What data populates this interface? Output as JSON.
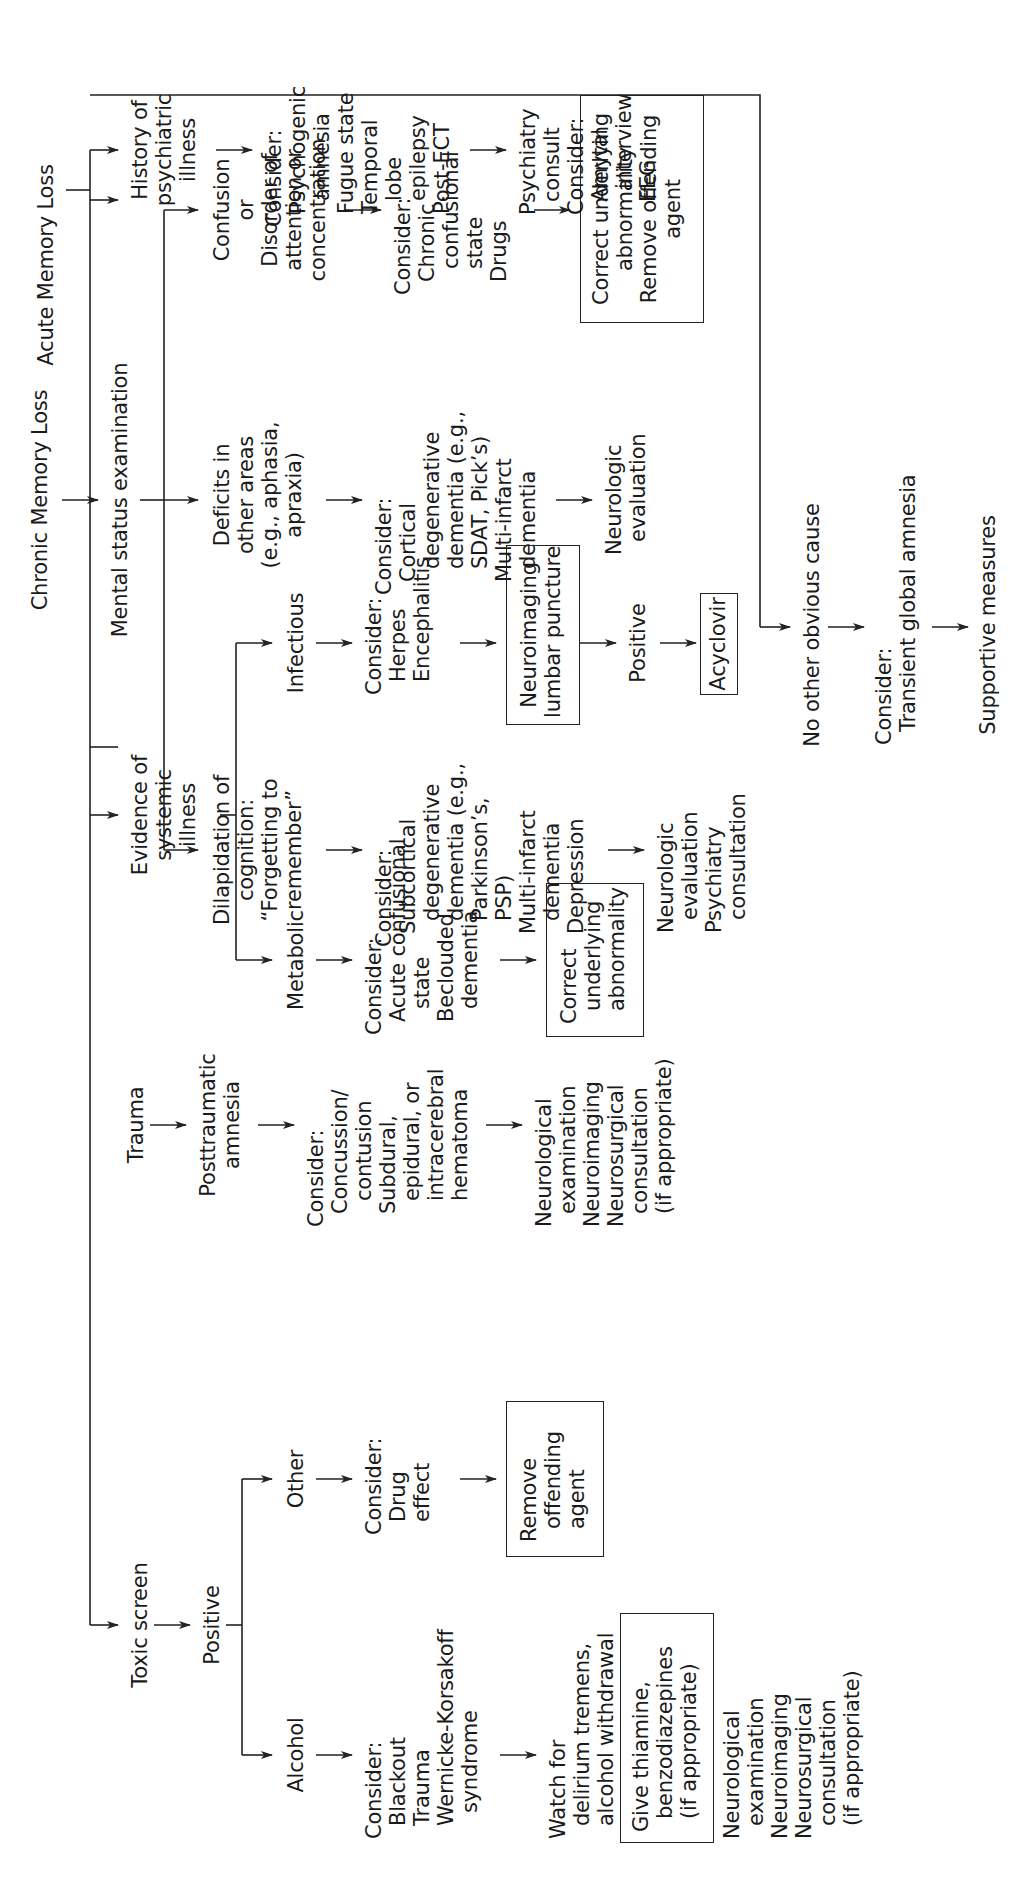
{
  "chronic": {
    "title": "Chronic Memory Loss",
    "exam": "Mental status examination",
    "branches": [
      {
        "finding": "Dilapidation of\ncognition:\n“Forgetting to\nremember”",
        "consider": "Consider:\n  Subcortical\n    degenerative\n    dementia (e.g.,\n    Parkinson’s,\n    PSP)\n  Multi-infarct\n    dementia\n  Depression",
        "action": "Neurologic\n  evaluation\nPsychiatry\n  consultation"
      },
      {
        "finding": "Deficits in\nother areas\n(e.g., aphasia,\napraxia)",
        "consider": "Consider:\n  Cortical\n    degenerative\n    dementia (e.g.,\n    SDAT, Pick’s)\n  Multi-infarct\n    dementia",
        "action": "Neurologic\n  evaluation"
      },
      {
        "finding": "Confusion\nor\nDisorder of\nattention or\nconcentration",
        "consider": "Consider:\n  Chronic\n    confusional\n    state\n  Drugs",
        "action_box": "Correct underlying\nabnormality\nRemove offending\nagent"
      }
    ]
  },
  "acute": {
    "title": "Acute Memory Loss",
    "toxic": {
      "label": "Toxic screen",
      "positive": "Positive",
      "alcohol": {
        "label": "Alcohol",
        "consider": "Consider:\n  Blackout\n  Trauma\n  Wernicke-Korsakoff\n    syndrome",
        "watch": "Watch for\n  delirium tremens,\n  alcohol withdrawal",
        "box": "Give thiamine,\n  benzodiazepines\n  (if appropriate)",
        "followup": "Neurological\n  examination\nNeuroimaging\nNeurosurgical\n  consultation\n  (if appropriate)"
      },
      "other": {
        "label": "Other",
        "consider": "Consider:\n  Drug\n  effect",
        "box": "Remove\n  offending\n  agent"
      }
    },
    "trauma": {
      "label": "Trauma",
      "result": "Posttraumatic\namnesia",
      "consider": "Consider:\n  Concussion/\n    contusion\n  Subdural,\n    epidural, or\n    intracerebral\n    hematoma",
      "action": "Neurological\n  examination\nNeuroimaging\nNeurosurgical\n  consultation\n  (if appropriate)"
    },
    "systemic": {
      "label": "Evidence of\nsystemic\nillness",
      "metabolic": {
        "label": "Metabolic",
        "consider": "Consider:\n  Acute confusional\n    state\n  Beclouded\n    dementia",
        "box": "Correct\n  underlying\n  abnormality"
      },
      "infectious": {
        "label": "Infectious",
        "consider": "Consider:\n  Herpes\n  Encephalitis",
        "box": "Neuroimaging\nlumbar puncture",
        "positive": "Positive",
        "treat_box": "Acyclovir"
      }
    },
    "psychiatric": {
      "label": "History of\npsychiatric\nillness",
      "consider": "Consider:\n  Psychogenic\n    amnesia\n  Fugue state\n  Temporal\n    lobe\n    epilepsy\n  Post-ECT",
      "action": "Psychiatry\n  consult\nConsider:\n  Amytal\n    interview\n  EEG"
    },
    "no_cause": {
      "label": "No other obvious cause",
      "consider": "Consider:\n  Transient global amnesia",
      "action": "Supportive measures"
    }
  },
  "colors": {
    "ink": "#222222",
    "background": "#ffffff"
  }
}
